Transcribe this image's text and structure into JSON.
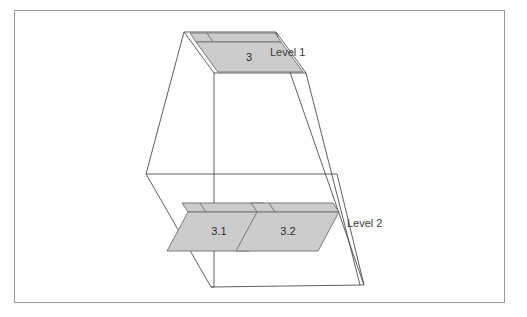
{
  "figure": {
    "title": "",
    "type": "3d-perspective-level-diagram",
    "frame": {
      "border_color": "#9a9a9a",
      "background": "#ffffff"
    },
    "style": {
      "line_color": "#4d4d4d",
      "cell_fill": "#cccccc",
      "cell_stroke": "#6e6e6e",
      "text_color": "#2b2b2b",
      "label_color": "#3a3a3a"
    },
    "levels": [
      {
        "id": "level-1",
        "label": "Level 1"
      },
      {
        "id": "level-2",
        "label": "Level 2"
      }
    ],
    "cells": [
      {
        "id": "cell-3",
        "label": "3",
        "level": "level-1"
      },
      {
        "id": "cell-3-1",
        "label": "3.1",
        "level": "level-2"
      },
      {
        "id": "cell-3-2",
        "label": "3.2",
        "level": "level-2"
      }
    ]
  }
}
